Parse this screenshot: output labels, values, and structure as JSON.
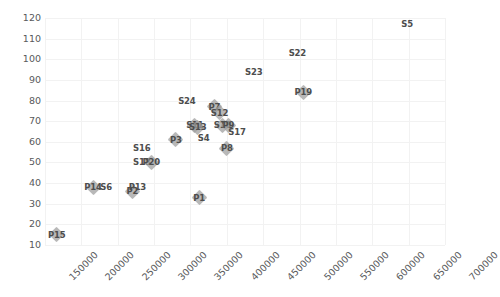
{
  "chart_data": {
    "type": "scatter",
    "title": "",
    "xlabel": "",
    "ylabel": "",
    "xlim": [
      150000,
      700000
    ],
    "ylim": [
      10,
      120
    ],
    "grid": true,
    "legend": "none",
    "marker_style": "diamond",
    "marker_color": "#9c9c9c",
    "label_color": "#4d4d4d",
    "x_ticks": [
      150000,
      200000,
      250000,
      300000,
      350000,
      400000,
      450000,
      500000,
      550000,
      600000,
      650000,
      700000
    ],
    "x_tick_labels": [
      "150000",
      "200000",
      "250000",
      "300000",
      "350000",
      "400000",
      "450000",
      "500000",
      "550000",
      "600000",
      "650000",
      "700000"
    ],
    "x_tick_rotation": -45,
    "y_ticks": [
      10,
      20,
      30,
      40,
      50,
      60,
      70,
      80,
      90,
      100,
      110,
      120
    ],
    "y_tick_labels": [
      "10",
      "20",
      "30",
      "40",
      "50",
      "60",
      "70",
      "80",
      "90",
      "100",
      "110",
      "120"
    ],
    "points": [
      {
        "label": "P15",
        "x": 166000,
        "y": 15,
        "marker": true
      },
      {
        "label": "P14",
        "x": 216000,
        "y": 38,
        "marker": true
      },
      {
        "label": "S6",
        "x": 234000,
        "y": 38,
        "marker": false
      },
      {
        "label": "P2",
        "x": 270000,
        "y": 36,
        "marker": true
      },
      {
        "label": "P13",
        "x": 277000,
        "y": 38,
        "marker": false
      },
      {
        "label": "S18",
        "x": 283000,
        "y": 50,
        "marker": false
      },
      {
        "label": "P20",
        "x": 296000,
        "y": 50,
        "marker": true
      },
      {
        "label": "S16",
        "x": 283000,
        "y": 57,
        "marker": false
      },
      {
        "label": "P3",
        "x": 330000,
        "y": 61,
        "marker": true
      },
      {
        "label": "P1",
        "x": 362000,
        "y": 33,
        "marker": true
      },
      {
        "label": "S24",
        "x": 345000,
        "y": 80,
        "marker": false
      },
      {
        "label": "S11",
        "x": 356000,
        "y": 68,
        "marker": true
      },
      {
        "label": "S13",
        "x": 360000,
        "y": 67,
        "marker": true
      },
      {
        "label": "S4",
        "x": 368000,
        "y": 62,
        "marker": false
      },
      {
        "label": "P7",
        "x": 383000,
        "y": 77,
        "marker": true
      },
      {
        "label": "S12",
        "x": 390000,
        "y": 74,
        "marker": true
      },
      {
        "label": "S10",
        "x": 394000,
        "y": 68,
        "marker": true
      },
      {
        "label": "P9",
        "x": 402000,
        "y": 68,
        "marker": true
      },
      {
        "label": "P8",
        "x": 400000,
        "y": 57,
        "marker": true
      },
      {
        "label": "S17",
        "x": 414000,
        "y": 65,
        "marker": false
      },
      {
        "label": "S23",
        "x": 437000,
        "y": 94,
        "marker": false
      },
      {
        "label": "S22",
        "x": 497000,
        "y": 103,
        "marker": false
      },
      {
        "label": "P19",
        "x": 505000,
        "y": 84,
        "marker": true
      },
      {
        "label": "S5",
        "x": 648000,
        "y": 117,
        "marker": false
      }
    ]
  }
}
